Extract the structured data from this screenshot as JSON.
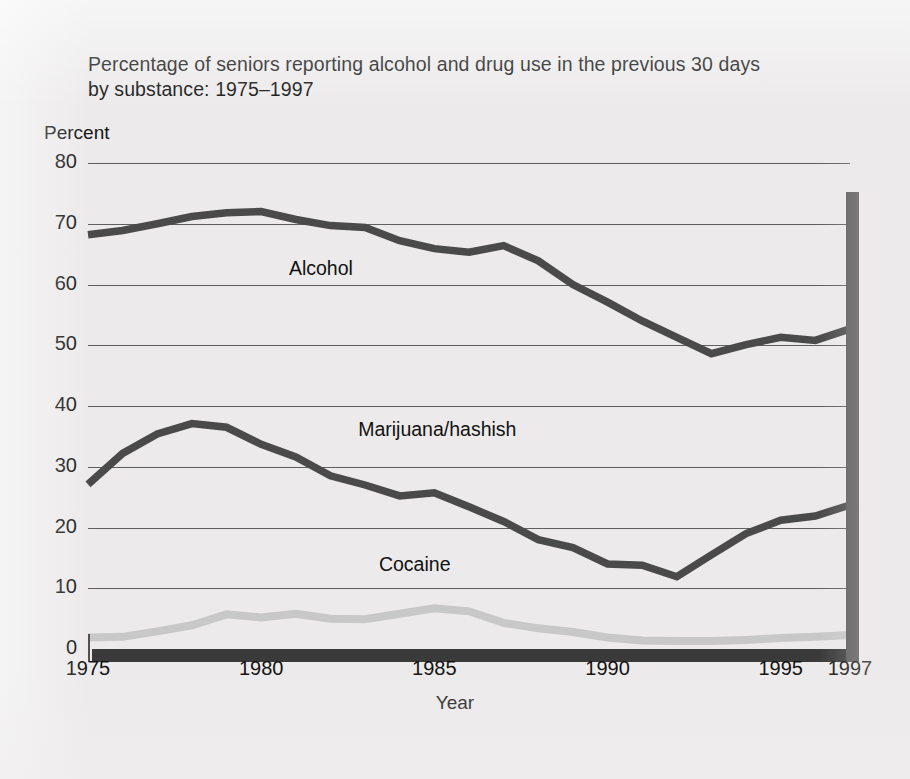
{
  "chart_data": {
    "type": "line",
    "title": "Percentage of seniors reporting alcohol and drug use in the previous 30 days by substance: 1975–1997",
    "title_line1": "Percentage of seniors reporting alcohol and drug use in the previous 30 days",
    "title_line2": "by substance: 1975–1997",
    "xlabel": "Year",
    "ylabel": "Percent",
    "xlim": [
      1975,
      1997
    ],
    "ylim": [
      0,
      80
    ],
    "grid": true,
    "legend": "inline-labels",
    "ytick_labels": [
      "0",
      "10",
      "20",
      "30",
      "40",
      "50",
      "60",
      "70",
      "80"
    ],
    "ytick_values": [
      0,
      10,
      20,
      30,
      40,
      50,
      60,
      70,
      80
    ],
    "xtick_labels": [
      "1975",
      "1980",
      "1985",
      "1990",
      "1995",
      "1997"
    ],
    "xtick_values": [
      1975,
      1980,
      1985,
      1990,
      1995,
      1997
    ],
    "x": [
      1975,
      1976,
      1977,
      1978,
      1979,
      1980,
      1981,
      1982,
      1983,
      1984,
      1985,
      1986,
      1987,
      1988,
      1989,
      1990,
      1991,
      1992,
      1993,
      1994,
      1995,
      1996,
      1997
    ],
    "series": [
      {
        "name": "Alcohol",
        "color": "#4a4a4a",
        "label_x": 1980.8,
        "label_y": 62.5,
        "values": [
          68.2,
          68.9,
          70.0,
          71.2,
          71.8,
          72.0,
          70.7,
          69.7,
          69.4,
          67.2,
          65.9,
          65.3,
          66.4,
          63.9,
          60.0,
          57.1,
          54.0,
          51.3,
          48.6,
          50.1,
          51.3,
          50.8,
          52.7
        ]
      },
      {
        "name": "Marijuana/hashish",
        "color": "#4a4a4a",
        "label_x": 1982.8,
        "label_y": 36.0,
        "values": [
          27.1,
          32.2,
          35.4,
          37.1,
          36.5,
          33.7,
          31.6,
          28.5,
          27.0,
          25.2,
          25.7,
          23.4,
          21.0,
          18.0,
          16.7,
          14.0,
          13.8,
          11.9,
          15.5,
          19.0,
          21.2,
          21.9,
          23.7
        ]
      },
      {
        "name": "Cocaine",
        "color": "#c8c8c8",
        "label_x": 1983.4,
        "label_y": 13.8,
        "values": [
          1.9,
          2.0,
          2.9,
          3.9,
          5.7,
          5.2,
          5.8,
          5.0,
          4.9,
          5.8,
          6.7,
          6.2,
          4.3,
          3.4,
          2.8,
          1.9,
          1.4,
          1.3,
          1.3,
          1.5,
          1.8,
          2.0,
          2.3
        ]
      }
    ]
  }
}
